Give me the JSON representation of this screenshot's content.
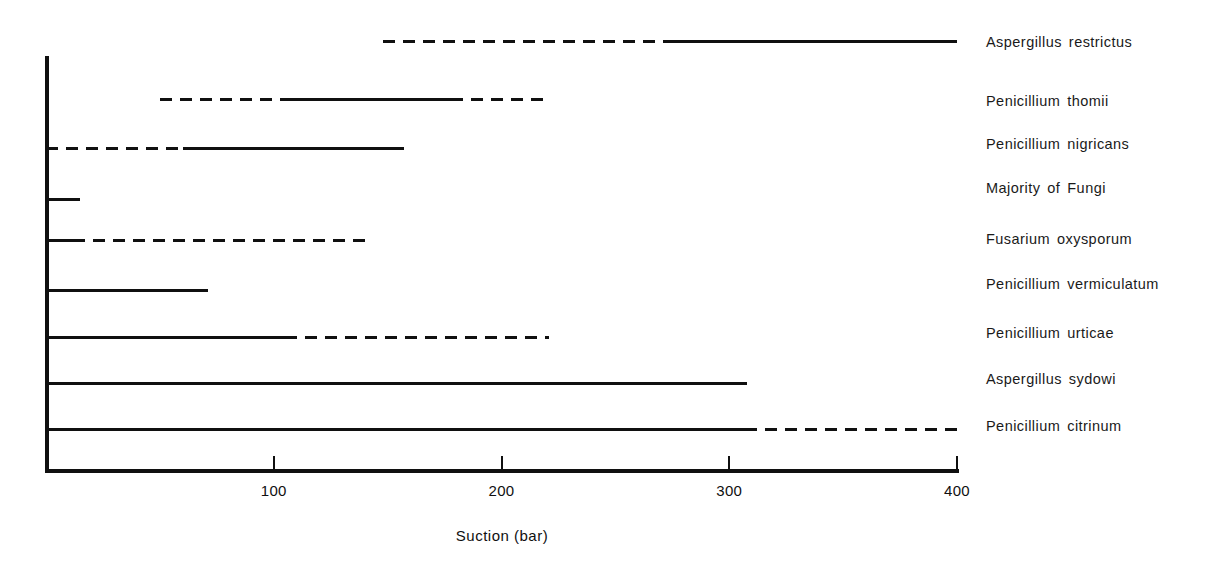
{
  "chart_data": {
    "type": "bar",
    "title": "",
    "subtitle": "",
    "xlabel": "Suction (bar)",
    "ylabel": "",
    "xlim": [
      0,
      400
    ],
    "xticks": [
      100,
      200,
      300,
      400
    ],
    "xtick_labels": [
      "100",
      "200",
      "300",
      "400"
    ],
    "grid": false,
    "legend": null,
    "orientation": "horizontal",
    "categories": [
      "Aspergillus restrictus",
      "Penicillium thomii",
      "Penicillium nigricans",
      "Majority of Fungi",
      "Fusarium oxysporum",
      "Penicillium vermiculatum",
      "Penicillium urticae",
      "Aspergillus sydowi",
      "Penicillium citrinum"
    ],
    "series": [
      {
        "name": "Aspergillus restrictus",
        "start": 148,
        "end": 400,
        "segments": [
          {
            "from": 148,
            "to": 275,
            "style": "dashed"
          },
          {
            "from": 275,
            "to": 400,
            "style": "solid"
          }
        ]
      },
      {
        "name": "Penicillium thomii",
        "start": 50,
        "end": 221,
        "segments": [
          {
            "from": 50,
            "to": 103,
            "style": "dashed"
          },
          {
            "from": 103,
            "to": 178,
            "style": "solid"
          },
          {
            "from": 178,
            "to": 221,
            "style": "dashed"
          }
        ]
      },
      {
        "name": "Penicillium nigricans",
        "start": 0,
        "end": 157,
        "segments": [
          {
            "from": 0,
            "to": 60,
            "style": "dashed"
          },
          {
            "from": 60,
            "to": 157,
            "style": "solid"
          }
        ]
      },
      {
        "name": "Majority of Fungi",
        "start": 0,
        "end": 15,
        "segments": [
          {
            "from": 0,
            "to": 15,
            "style": "solid"
          }
        ]
      },
      {
        "name": "Fusarium oxysporum",
        "start": 0,
        "end": 143,
        "segments": [
          {
            "from": 0,
            "to": 12,
            "style": "solid"
          },
          {
            "from": 12,
            "to": 143,
            "style": "dashed"
          }
        ]
      },
      {
        "name": "Penicillium vermiculatum",
        "start": 0,
        "end": 71,
        "segments": [
          {
            "from": 0,
            "to": 71,
            "style": "solid"
          }
        ]
      },
      {
        "name": "Penicillium urticae",
        "start": 0,
        "end": 221,
        "segments": [
          {
            "from": 0,
            "to": 105,
            "style": "solid"
          },
          {
            "from": 105,
            "to": 221,
            "style": "dashed"
          }
        ]
      },
      {
        "name": "Aspergillus sydowi",
        "start": 0,
        "end": 308,
        "segments": [
          {
            "from": 0,
            "to": 308,
            "style": "solid"
          }
        ]
      },
      {
        "name": "Penicillium citrinum",
        "start": 0,
        "end": 400,
        "segments": [
          {
            "from": 0,
            "to": 307,
            "style": "solid"
          },
          {
            "from": 307,
            "to": 400,
            "style": "dashed"
          }
        ]
      }
    ]
  },
  "axis": {
    "title": "Suction (bar)",
    "ticks": [
      {
        "value": 100,
        "label": "100"
      },
      {
        "value": 200,
        "label": "200"
      },
      {
        "value": 300,
        "label": "300"
      },
      {
        "value": 400,
        "label": "400"
      }
    ]
  },
  "labels": {
    "items": [
      {
        "text": "Aspergillus restrictus"
      },
      {
        "text": "Penicillium thomii"
      },
      {
        "text": "Penicillium nigricans"
      },
      {
        "text": "Majority of Fungi"
      },
      {
        "text": "Fusarium oxysporum"
      },
      {
        "text": "Penicillium vermiculatum"
      },
      {
        "text": "Penicillium urticae"
      },
      {
        "text": "Aspergillus sydowi"
      },
      {
        "text": "Penicillium citrinum"
      }
    ]
  },
  "colors": {
    "ink": "#101010",
    "background": "#ffffff"
  }
}
